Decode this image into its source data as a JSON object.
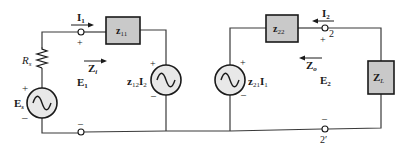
{
  "diagram": {
    "type": "two-port z-parameter equivalent circuit",
    "left_port": {
      "source": {
        "label": "E",
        "subscript": "s",
        "plus": "+",
        "minus": "–"
      },
      "resistor": {
        "label": "R",
        "subscript": "s"
      },
      "current": {
        "label": "I",
        "subscript": "1"
      },
      "voltage": {
        "label": "E",
        "subscript": "1",
        "plus": "+",
        "minus": "–"
      },
      "impedance_arrow": {
        "label": "Z",
        "subscript": "i"
      }
    },
    "boxes": {
      "z11": {
        "label": "z",
        "subscript": "11"
      },
      "z22": {
        "label": "z",
        "subscript": "22"
      },
      "zl": {
        "label": "Z",
        "subscript": "L"
      }
    },
    "dependent_sources": {
      "left": {
        "label_z": "z",
        "sub_z": "12",
        "label_i": "I",
        "sub_i": "2",
        "plus": "+",
        "minus": "–"
      },
      "right": {
        "label_z": "z",
        "sub_z": "21",
        "label_i": "I",
        "sub_i": "1",
        "plus": "+",
        "minus": "–"
      }
    },
    "right_port": {
      "current": {
        "label": "I",
        "subscript": "2"
      },
      "voltage": {
        "label": "E",
        "subscript": "2",
        "plus": "+",
        "minus": "–"
      },
      "impedance_arrow": {
        "label": "Z",
        "subscript": "o"
      },
      "terminal_top": "2",
      "terminal_bottom": "2′"
    }
  }
}
